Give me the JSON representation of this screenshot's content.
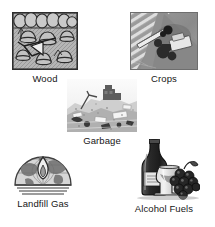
{
  "figure": {
    "background_color": "#ffffff",
    "text_color": "#161616",
    "items": [
      {
        "id": "wood",
        "label": "Wood",
        "icon_name": "wood-forest-illustration",
        "art_style": "engraved line drawing",
        "subject": "forest with trees and cut tree stumps",
        "frame_color": "#3a3a3a",
        "fill_color": "#b9b9b9"
      },
      {
        "id": "crops",
        "label": "Crops",
        "icon_name": "crops-aerial-photo",
        "art_style": "grayscale photograph",
        "subject": "aerial view of combine harvester in striped crop field",
        "frame_color": "#6e6e6e",
        "fill_color": "#9a9a9a"
      },
      {
        "id": "garbage",
        "label": "Garbage",
        "icon_name": "garbage-landfill-photo",
        "art_style": "grayscale photograph",
        "subject": "landfill refuse pile with bulldozer",
        "frame_color": "#8a8a8a",
        "fill_color": "#d8d8d8"
      },
      {
        "id": "landfill-gas",
        "label": "Landfill Gas",
        "icon_name": "landfill-gas-globe-flame-logo",
        "art_style": "line logo",
        "subject": "globe hemisphere with flame over horizontal lines",
        "frame_color": "#4a4a4a",
        "fill_color": "#c8c8c8"
      },
      {
        "id": "alcohol-fuels",
        "label": "Alcohol Fuels",
        "icon_name": "alcohol-fuels-bottle-glass-grapes",
        "art_style": "engraved illustration",
        "subject": "wine bottle, wine glass and bunch of grapes",
        "frame_color": "#222222",
        "fill_color": "#3c3c3c"
      }
    ]
  }
}
